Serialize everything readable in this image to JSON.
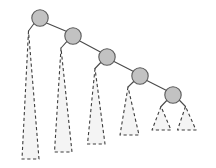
{
  "figure": {
    "background_color": "#ffffff",
    "width": 216,
    "height": 168,
    "style": {
      "node_fill": "#c2c2c2",
      "node_stroke": "#5a5a5a",
      "edge_stroke": "#4a4a4a",
      "triangle_fill": "#f4f4f4",
      "triangle_stroke": "#3d3d3d",
      "triangle_dash": "3.2 2.6",
      "stroke_width": 1.1
    }
  },
  "diagram": {
    "type": "tree",
    "node_radius": 8.2,
    "nodes": [
      {
        "id": "n1",
        "label": "",
        "cx": 40,
        "cy": 18
      },
      {
        "id": "n2",
        "label": "",
        "cx": 73,
        "cy": 36
      },
      {
        "id": "n3",
        "label": "",
        "cx": 107,
        "cy": 57
      },
      {
        "id": "n4",
        "label": "",
        "cx": 140,
        "cy": 76
      },
      {
        "id": "n5",
        "label": "",
        "cx": 173,
        "cy": 95
      }
    ],
    "edges": [
      {
        "id": "e-n1-n2",
        "from": "n1",
        "to": "n2",
        "x1": 46.5,
        "y1": 23.0,
        "x2": 66.8,
        "y2": 31.6
      },
      {
        "id": "e-n2-n3",
        "from": "n2",
        "to": "n3",
        "x1": 79.8,
        "y1": 41.0,
        "x2": 100.4,
        "y2": 52.0
      },
      {
        "id": "e-n3-n4",
        "from": "n3",
        "to": "n4",
        "x1": 114.0,
        "y1": 61.5,
        "x2": 133.6,
        "y2": 71.4
      },
      {
        "id": "e-n4-n5",
        "from": "n4",
        "to": "n5",
        "x1": 146.8,
        "y1": 80.6,
        "x2": 166.6,
        "y2": 90.6
      },
      {
        "id": "e-n1-t1",
        "from": "n1",
        "to": "t1",
        "x1": 34.2,
        "y1": 23.2,
        "x2": 28.5,
        "y2": 31.0
      },
      {
        "id": "e-n2-t2",
        "from": "n2",
        "to": "t2",
        "x1": 67.2,
        "y1": 41.2,
        "x2": 61.0,
        "y2": 48.0
      },
      {
        "id": "e-n3-t3",
        "from": "n3",
        "to": "t3",
        "x1": 101.2,
        "y1": 62.0,
        "x2": 95.0,
        "y2": 68.5
      },
      {
        "id": "e-n4-t4",
        "from": "n4",
        "to": "t4",
        "x1": 134.2,
        "y1": 81.0,
        "x2": 128.0,
        "y2": 87.0
      },
      {
        "id": "e-n5-t5",
        "from": "n5",
        "to": "t5",
        "x1": 167.2,
        "y1": 100.0,
        "x2": 161.0,
        "y2": 106.5
      },
      {
        "id": "e-n5-t6",
        "from": "n5",
        "to": "t6",
        "x1": 179.2,
        "y1": 100.0,
        "x2": 185.5,
        "y2": 106.5
      }
    ],
    "subtrees": [
      {
        "id": "t1",
        "label": "",
        "parent": "n1",
        "side": "left",
        "apex_x": 28.5,
        "apex_y": 31.0,
        "base_y": 159.0,
        "base_left_x": 22.0,
        "base_right_x": 39.0
      },
      {
        "id": "t2",
        "label": "",
        "parent": "n2",
        "side": "left",
        "apex_x": 61.0,
        "apex_y": 48.0,
        "base_y": 152.0,
        "base_left_x": 54.5,
        "base_right_x": 72.0
      },
      {
        "id": "t3",
        "label": "",
        "parent": "n3",
        "side": "left",
        "apex_x": 95.0,
        "apex_y": 68.5,
        "base_y": 144.0,
        "base_left_x": 87.5,
        "base_right_x": 105.0
      },
      {
        "id": "t4",
        "label": "",
        "parent": "n4",
        "side": "left",
        "apex_x": 128.0,
        "apex_y": 87.0,
        "base_y": 135.0,
        "base_left_x": 120.0,
        "base_right_x": 139.0
      },
      {
        "id": "t5",
        "label": "",
        "parent": "n5",
        "side": "left",
        "apex_x": 161.0,
        "apex_y": 106.5,
        "base_y": 130.0,
        "base_left_x": 152.0,
        "base_right_x": 171.0
      },
      {
        "id": "t6",
        "label": "",
        "parent": "n5",
        "side": "right",
        "apex_x": 185.5,
        "apex_y": 106.5,
        "base_y": 130.0,
        "base_left_x": 177.5,
        "base_right_x": 196.0
      }
    ]
  }
}
